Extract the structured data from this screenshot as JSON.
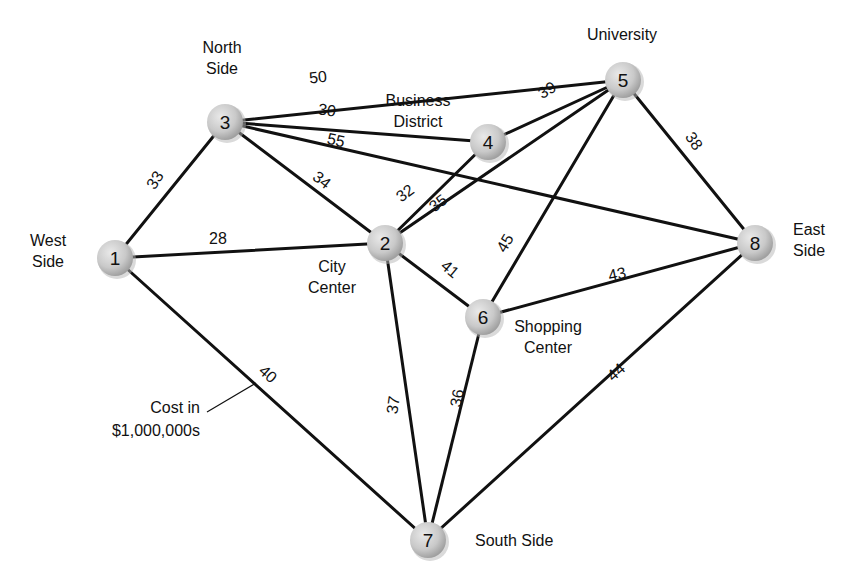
{
  "diagram": {
    "type": "weighted-graph",
    "legend": {
      "line1": "Cost in",
      "line2": "$1,000,000s"
    },
    "nodes": [
      {
        "id": "1",
        "x": 115,
        "y": 258,
        "label": [
          "West",
          "Side"
        ],
        "label_x": 48,
        "label_y": 246,
        "anchor": "middle"
      },
      {
        "id": "2",
        "x": 385,
        "y": 243,
        "label": [
          "City",
          "Center"
        ],
        "label_x": 332,
        "label_y": 272,
        "anchor": "middle"
      },
      {
        "id": "3",
        "x": 225,
        "y": 122,
        "label": [
          "North",
          "Side"
        ],
        "label_x": 222,
        "label_y": 53,
        "anchor": "middle"
      },
      {
        "id": "4",
        "x": 488,
        "y": 142,
        "label": [
          "Business",
          "District"
        ],
        "label_x": 418,
        "label_y": 106,
        "anchor": "middle"
      },
      {
        "id": "5",
        "x": 623,
        "y": 80,
        "label": [
          "University"
        ],
        "label_x": 622,
        "label_y": 40,
        "anchor": "middle"
      },
      {
        "id": "6",
        "x": 483,
        "y": 317,
        "label": [
          "Shopping",
          "Center"
        ],
        "label_x": 548,
        "label_y": 332,
        "anchor": "middle"
      },
      {
        "id": "7",
        "x": 428,
        "y": 540,
        "label": [
          "South Side"
        ],
        "label_x": 475,
        "label_y": 546,
        "anchor": "start"
      },
      {
        "id": "8",
        "x": 755,
        "y": 243,
        "label": [
          "East",
          "Side"
        ],
        "label_x": 793,
        "label_y": 235,
        "anchor": "start"
      }
    ],
    "edges": [
      {
        "from": "1",
        "to": "3",
        "weight": "33",
        "lx": 155,
        "ly": 180,
        "rot": -57
      },
      {
        "from": "1",
        "to": "2",
        "weight": "28",
        "lx": 218,
        "ly": 238,
        "rot": 0
      },
      {
        "from": "1",
        "to": "7",
        "weight": "40",
        "lx": 268,
        "ly": 374,
        "rot": 42
      },
      {
        "from": "3",
        "to": "5",
        "weight": "50",
        "lx": 318,
        "ly": 77,
        "rot": -6
      },
      {
        "from": "3",
        "to": "4",
        "weight": "30",
        "lx": 327,
        "ly": 110,
        "rot": 8
      },
      {
        "from": "3",
        "to": "8",
        "weight": "55",
        "lx": 336,
        "ly": 140,
        "rot": 12
      },
      {
        "from": "3",
        "to": "2",
        "weight": "34",
        "lx": 322,
        "ly": 180,
        "rot": 38
      },
      {
        "from": "4",
        "to": "5",
        "weight": "39",
        "lx": 547,
        "ly": 90,
        "rot": -30
      },
      {
        "from": "2",
        "to": "4",
        "weight": "32",
        "lx": 405,
        "ly": 193,
        "rot": -37
      },
      {
        "from": "2",
        "to": "5",
        "weight": "35",
        "lx": 438,
        "ly": 203,
        "rot": -37
      },
      {
        "from": "5",
        "to": "8",
        "weight": "38",
        "lx": 694,
        "ly": 141,
        "rot": 55
      },
      {
        "from": "2",
        "to": "6",
        "weight": "41",
        "lx": 450,
        "ly": 269,
        "rot": 40
      },
      {
        "from": "6",
        "to": "5",
        "weight": "45",
        "lx": 505,
        "ly": 243,
        "rot": -60
      },
      {
        "from": "6",
        "to": "8",
        "weight": "43",
        "lx": 617,
        "ly": 274,
        "rot": -12
      },
      {
        "from": "2",
        "to": "7",
        "weight": "37",
        "lx": 393,
        "ly": 405,
        "rot": -82
      },
      {
        "from": "6",
        "to": "7",
        "weight": "36",
        "lx": 457,
        "ly": 398,
        "rot": -80
      },
      {
        "from": "8",
        "to": "7",
        "weight": "44",
        "lx": 616,
        "ly": 372,
        "rot": -42
      }
    ],
    "leader": {
      "x1": 207,
      "y1": 412,
      "x2": 256,
      "y2": 383
    }
  }
}
